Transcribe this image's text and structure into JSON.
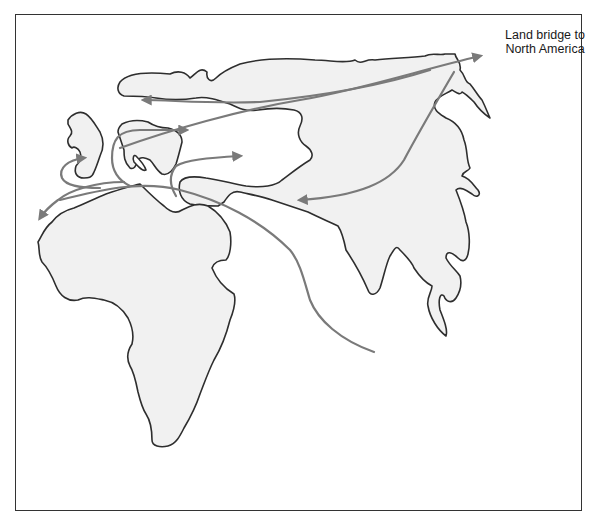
{
  "diagram": {
    "type": "migration-map",
    "annotations": {
      "land_bridge_label": "Land bridge to North America"
    },
    "regions": [
      "Africa",
      "Europe",
      "Asia",
      "British Isles",
      "Scandinavia",
      "Arabian Peninsula",
      "India",
      "Southeast Asia",
      "Kamchatka"
    ],
    "routes": [
      {
        "id": "eastward-to-land-bridge",
        "from": "Asia interior",
        "to": "Land bridge to North America",
        "direction": "northeast"
      },
      {
        "id": "westward-north-europe",
        "from": "Land bridge region",
        "to": "Northern Europe / Scandinavia",
        "direction": "west"
      },
      {
        "id": "southwest-from-land-bridge",
        "from": "Land bridge region",
        "to": "Central Asia",
        "direction": "southwest"
      },
      {
        "id": "to-western-europe",
        "from": "North Africa",
        "to": "Western Europe",
        "direction": "north"
      },
      {
        "id": "to-west-africa",
        "from": "North Africa",
        "to": "West Africa",
        "direction": "southwest"
      },
      {
        "id": "to-northern-europe",
        "from": "Near East",
        "to": "Northern Europe",
        "direction": "east"
      },
      {
        "id": "to-eastern-europe",
        "from": "Near East",
        "to": "Eastern Europe",
        "direction": "east"
      },
      {
        "id": "coastal-route-south-asia",
        "from": "Northeast Africa",
        "to": "South Asia coast",
        "direction": "southeast"
      }
    ],
    "colors": {
      "land_fill": "#f1f1f1",
      "coastline": "#2e2e2e",
      "route_arrows": "#7a7a7a",
      "background": "#ffffff",
      "frame": "#333333"
    }
  }
}
